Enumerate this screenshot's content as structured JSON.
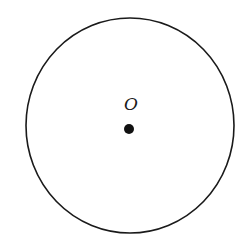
{
  "diagram": {
    "type": "circle-with-center",
    "circle": {
      "cx": 130,
      "cy": 125.5,
      "rx": 104,
      "ry": 107.5,
      "stroke": "#1a1a1a",
      "stroke_width": 1.6
    },
    "center_point": {
      "x": 129,
      "y": 129,
      "r": 5,
      "fill": "#111111"
    },
    "center_label": {
      "text": "O",
      "x": 131,
      "y": 110
    }
  }
}
